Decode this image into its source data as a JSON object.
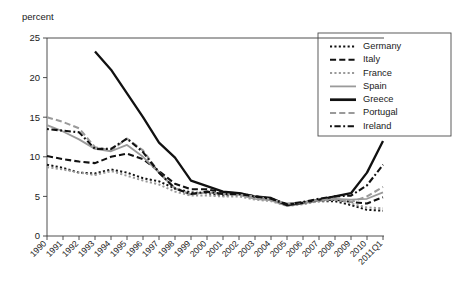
{
  "chart_data": {
    "type": "line",
    "title": "",
    "subtitle": "",
    "xlabel": "",
    "ylabel": "percent",
    "ylim": [
      0,
      25
    ],
    "yticks": [
      0,
      5,
      10,
      15,
      20,
      25
    ],
    "grid": false,
    "legend_position": "top-right",
    "categories": [
      "1990",
      "1991",
      "1992",
      "1993",
      "1994",
      "1995",
      "1996",
      "1997",
      "1998",
      "1999",
      "2000",
      "2001",
      "2002",
      "2003",
      "2004",
      "2005",
      "2006",
      "2007",
      "2008",
      "2009",
      "2010",
      "2011Q1"
    ],
    "series": [
      {
        "name": "Germany",
        "style": "dotted",
        "color": "#111111",
        "width": 2.0,
        "values": [
          9.0,
          8.6,
          8.0,
          7.9,
          8.4,
          8.0,
          7.3,
          6.9,
          6.0,
          5.5,
          5.4,
          5.1,
          5.2,
          4.9,
          4.6,
          4.0,
          4.2,
          4.4,
          4.4,
          3.9,
          3.3,
          3.2
        ]
      },
      {
        "name": "Italy",
        "style": "dashed",
        "color": "#111111",
        "width": 2.1,
        "values": [
          10.1,
          9.7,
          9.4,
          9.2,
          10.0,
          10.4,
          9.7,
          8.2,
          6.6,
          5.9,
          5.9,
          5.5,
          5.4,
          5.0,
          4.7,
          4.0,
          4.2,
          4.5,
          4.6,
          4.3,
          4.1,
          4.9
        ]
      },
      {
        "name": "France",
        "style": "dotted",
        "color": "#9a9a9a",
        "width": 2.0,
        "values": [
          8.7,
          8.4,
          8.0,
          7.7,
          8.2,
          7.6,
          7.0,
          6.5,
          5.6,
          5.1,
          5.1,
          5.0,
          5.0,
          4.6,
          4.4,
          3.8,
          4.0,
          4.4,
          4.6,
          4.1,
          3.6,
          3.5
        ]
      },
      {
        "name": "Spain",
        "style": "solid",
        "color": "#9a9a9a",
        "width": 1.8,
        "values": [
          14.0,
          13.2,
          12.2,
          11.0,
          10.7,
          11.5,
          10.0,
          8.0,
          6.0,
          5.3,
          5.5,
          5.3,
          5.2,
          4.7,
          4.5,
          3.8,
          4.1,
          4.5,
          4.7,
          4.6,
          4.7,
          5.5
        ]
      },
      {
        "name": "Greece",
        "style": "solid",
        "color": "#111111",
        "width": 2.3,
        "values": [
          null,
          null,
          null,
          23.3,
          21.0,
          18.0,
          15.0,
          11.8,
          9.9,
          7.0,
          6.3,
          5.6,
          5.4,
          5.0,
          4.8,
          3.9,
          4.2,
          4.6,
          5.0,
          5.4,
          8.0,
          12.0
        ]
      },
      {
        "name": "Portugal",
        "style": "dashed",
        "color": "#9a9a9a",
        "width": 2.1,
        "values": [
          15.0,
          14.4,
          13.6,
          11.2,
          10.8,
          12.3,
          10.8,
          8.0,
          6.0,
          5.2,
          5.6,
          5.3,
          5.2,
          5.0,
          4.6,
          4.1,
          4.2,
          4.6,
          4.7,
          4.3,
          5.0,
          6.2
        ]
      },
      {
        "name": "Ireland",
        "style": "dash-dot",
        "color": "#111111",
        "width": 2.1,
        "values": [
          13.5,
          13.3,
          13.1,
          11.0,
          11.0,
          12.3,
          10.6,
          8.0,
          6.0,
          5.3,
          5.6,
          5.3,
          5.3,
          5.0,
          4.7,
          4.0,
          4.3,
          4.7,
          5.0,
          5.1,
          6.4,
          9.0
        ]
      }
    ]
  },
  "legend": {
    "entries": [
      "Germany",
      "Italy",
      "France",
      "Spain",
      "Greece",
      "Portugal",
      "Ireland"
    ]
  }
}
